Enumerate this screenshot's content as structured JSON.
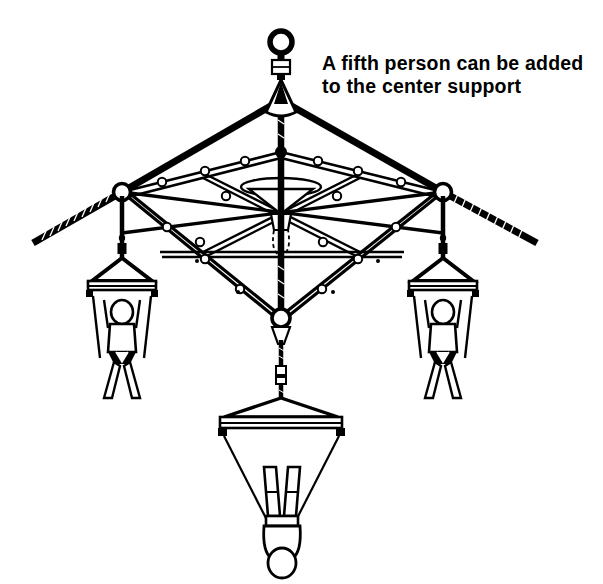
{
  "figure": {
    "background_color": "#ffffff",
    "ink_color": "#000000",
    "width": 603,
    "height": 584
  },
  "caption": {
    "line1": "A fifth person can be added",
    "line2": "to the center support",
    "x": 322,
    "y_line1": 70,
    "y_line2": 93,
    "font_weight": "bold",
    "font_size_px": 19.5
  },
  "apex": {
    "name": "master-lifting-eye",
    "ring_center_x": 281,
    "ring_center_y": 42,
    "ring_radius": 11,
    "shackle_label": "swivel-block",
    "cone_label": "rope-thimble-cone"
  },
  "frame": {
    "name": "square-spreader-frame",
    "shape": "square-in-perspective",
    "corners": {
      "top": {
        "x": 281,
        "y": 152
      },
      "left": {
        "x": 122,
        "y": 192
      },
      "right": {
        "x": 443,
        "y": 192
      },
      "bottom": {
        "x": 281,
        "y": 322
      }
    },
    "center_hub": {
      "x": 281,
      "y": 212,
      "label": "center-support-hub"
    },
    "ring_count_outer": 16,
    "ring_radius": 4.2
  },
  "ropes": {
    "vertical_main": {
      "from_y": 96,
      "to_y": 322,
      "width": 6
    },
    "diagonal_left": {
      "to_x": 122,
      "to_y": 192
    },
    "diagonal_right": {
      "to_x": 443,
      "to_y": 192
    },
    "tail_left_end": {
      "x": 33,
      "y": 243
    },
    "tail_right_end": {
      "x": 537,
      "y": 243
    },
    "texture": "hatched-twist"
  },
  "harnesses": [
    {
      "id": "left",
      "name": "harness-left",
      "anchor_x": 122,
      "anchor_y": 192,
      "bar_y": 280,
      "bar_half_width": 30,
      "figure_orientation": "front-facing",
      "person_label": "suspended-person"
    },
    {
      "id": "right",
      "name": "harness-right",
      "anchor_x": 443,
      "anchor_y": 192,
      "bar_y": 280,
      "bar_half_width": 30,
      "figure_orientation": "front-facing",
      "person_label": "suspended-person"
    },
    {
      "id": "bottom",
      "name": "harness-bottom-center",
      "anchor_x": 281,
      "anchor_y": 322,
      "bar_y": 415,
      "bar_half_width": 57,
      "figure_orientation": "rear-facing-inverted",
      "person_label": "suspended-person"
    }
  ],
  "people_count_shown": 3,
  "people_capacity_note": "fifth person at center support"
}
